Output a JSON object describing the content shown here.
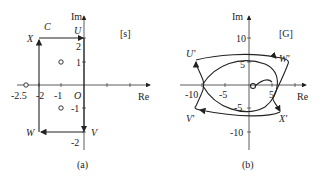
{
  "panel_a": {
    "caption": "(a)",
    "plane_label": "[s]",
    "axis_x": "Re",
    "axis_y": "Im",
    "origin": "O",
    "contour_label": "C",
    "corners": {
      "U": "U",
      "V": "V",
      "W": "W",
      "X": "X"
    },
    "x_ticks": [
      "-2.5",
      "-2",
      "-1"
    ],
    "y_ticks": [
      "2",
      "1",
      "-1",
      "-2"
    ],
    "points": [
      {
        "label": "zero",
        "re": -2.5,
        "im": 0
      },
      {
        "label": "zero",
        "re": -1,
        "im": 1
      },
      {
        "label": "zero",
        "re": -1,
        "im": -1
      }
    ]
  },
  "panel_b": {
    "caption": "(b)",
    "plane_label": "[G]",
    "axis_x": "Re",
    "axis_y": "Im",
    "corners": {
      "U": "U'",
      "V": "V'",
      "W": "W'",
      "X": "X'"
    },
    "x_ticks": [
      "-10",
      "-5",
      "5"
    ],
    "y_ticks": [
      "10",
      "5",
      "-5",
      "-10"
    ]
  }
}
